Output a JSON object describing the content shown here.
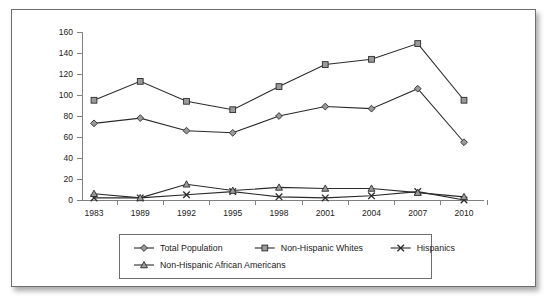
{
  "chart_data": {
    "type": "line",
    "title": "",
    "xlabel": "",
    "ylabel": "",
    "categories": [
      "1983",
      "1989",
      "1992",
      "1995",
      "1998",
      "2001",
      "2004",
      "2007",
      "2010"
    ],
    "ylim": [
      0,
      160
    ],
    "y_ticks": [
      "0",
      "20",
      "40",
      "60",
      "80",
      "100",
      "120",
      "140",
      "160"
    ],
    "grid": false,
    "legend_position": "bottom",
    "series": [
      {
        "name": "Total Population",
        "marker": "diamond",
        "values": [
          73,
          78,
          66,
          64,
          80,
          89,
          87,
          106,
          55
        ]
      },
      {
        "name": "Non-Hispanic Whites",
        "marker": "square",
        "values": [
          95,
          113,
          94,
          86,
          108,
          129,
          134,
          149,
          95
        ]
      },
      {
        "name": "Hispanics",
        "marker": "x",
        "values": [
          2,
          2,
          5,
          8,
          3,
          2,
          4,
          8,
          0
        ]
      },
      {
        "name": "Non-Hispanic African Americans",
        "marker": "triangle",
        "values": [
          6,
          2,
          15,
          9,
          12,
          11,
          11,
          7,
          3
        ]
      }
    ]
  },
  "legend": {
    "row1": [
      "Total Population",
      "Non-Hispanic Whites",
      "Hispanics"
    ],
    "row2": [
      "Non-Hispanic African Americans"
    ]
  },
  "colors": {
    "line": "#2b2b2b",
    "marker_fill": "#9a9a9a",
    "axis": "#808080",
    "frame": "#6e6e6e",
    "background": "#ffffff"
  }
}
